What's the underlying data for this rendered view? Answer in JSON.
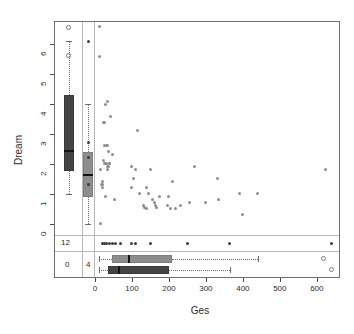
{
  "chart_data": {
    "type": "scatter",
    "title": "",
    "xlabel": "Ges",
    "ylabel": "Dream",
    "xlim": [
      -20,
      660
    ],
    "ylim": [
      -0.35,
      6.75
    ],
    "xticks": [
      0,
      100,
      200,
      300,
      400,
      500,
      600
    ],
    "xticklabels": [
      "0",
      "100",
      "200",
      "300",
      "400",
      "500",
      "600"
    ],
    "yticks": [
      0,
      1,
      2,
      3,
      4,
      5,
      6
    ],
    "yticklabels": [
      "0",
      "1",
      "2",
      "3",
      "4",
      "5",
      "6"
    ],
    "grid": false,
    "legend": null,
    "points": [
      [
        12.0,
        6.6
      ],
      [
        12.5,
        5.6
      ],
      [
        28.0,
        4.0
      ],
      [
        33.0,
        4.1
      ],
      [
        42.0,
        3.6
      ],
      [
        22.0,
        3.4
      ],
      [
        26.0,
        3.4
      ],
      [
        116.0,
        3.1
      ],
      [
        25.0,
        2.6
      ],
      [
        30.0,
        2.6
      ],
      [
        35.0,
        2.6
      ],
      [
        37.0,
        2.4
      ],
      [
        47.0,
        2.3
      ],
      [
        16.0,
        1.8
      ],
      [
        23.0,
        2.1
      ],
      [
        26.0,
        2.0
      ],
      [
        29.0,
        2.0
      ],
      [
        32.0,
        2.0
      ],
      [
        34.0,
        1.9
      ],
      [
        36.0,
        1.9
      ],
      [
        38.0,
        2.0
      ],
      [
        40.0,
        2.0
      ],
      [
        33.0,
        1.8
      ],
      [
        99.0,
        1.9
      ],
      [
        110.0,
        1.8
      ],
      [
        104.0,
        1.5
      ],
      [
        150.0,
        1.8
      ],
      [
        140.0,
        1.2
      ],
      [
        210.0,
        1.4
      ],
      [
        268.0,
        1.9
      ],
      [
        330.0,
        1.5
      ],
      [
        18.0,
        1.3
      ],
      [
        20.0,
        1.3
      ],
      [
        21.0,
        1.4
      ],
      [
        19.0,
        1.2
      ],
      [
        28.0,
        0.9
      ],
      [
        52.0,
        0.8
      ],
      [
        100.0,
        1.2
      ],
      [
        120.0,
        1.0
      ],
      [
        145.0,
        1.0
      ],
      [
        155.0,
        0.8
      ],
      [
        160.0,
        0.7
      ],
      [
        175.0,
        0.9
      ],
      [
        200.0,
        0.9
      ],
      [
        195.0,
        0.6
      ],
      [
        205.0,
        0.5
      ],
      [
        218.0,
        0.5
      ],
      [
        230.0,
        0.6
      ],
      [
        255.0,
        0.7
      ],
      [
        300.0,
        0.7
      ],
      [
        335.0,
        0.8
      ],
      [
        390.0,
        1.0
      ],
      [
        400.0,
        0.3
      ],
      [
        440.0,
        1.0
      ],
      [
        624.0,
        1.8
      ],
      [
        130.0,
        0.6
      ],
      [
        134.0,
        0.55
      ],
      [
        138.0,
        0.5
      ],
      [
        163.0,
        0.6
      ],
      [
        167.0,
        0.55
      ],
      [
        16.0,
        0.0
      ]
    ],
    "missing_x_points": [
      [
        6.1
      ],
      [
        2.7
      ],
      [
        2.2
      ],
      [
        1.3
      ]
    ],
    "missing_y_points": [
      20,
      26,
      32,
      40,
      48,
      56,
      68,
      100,
      110,
      150,
      250,
      365,
      640
    ],
    "missing_counts": {
      "y_missing_label": "12",
      "both_missing_label": "0",
      "x_missing_label": "4"
    },
    "y_boxplots": [
      {
        "name": "all-cases",
        "fill": "#444444",
        "min": 1.0,
        "q1": 1.75,
        "median": 2.45,
        "q3": 4.3,
        "max": 6.1,
        "outliers": [
          6.55,
          5.6
        ]
      },
      {
        "name": "complete-cases",
        "fill": "#8d8d8d",
        "min": 0.0,
        "q1": 0.9,
        "median": 1.65,
        "q3": 2.4,
        "max": 4.0,
        "outliers": []
      }
    ],
    "x_boxplots": [
      {
        "name": "complete-cases",
        "fill": "#8d8d8d",
        "min": 12,
        "q1": 46,
        "median": 90,
        "q3": 208,
        "max": 440,
        "outliers": [
          620
        ]
      },
      {
        "name": "all-cases",
        "fill": "#444444",
        "min": 10,
        "q1": 34,
        "median": 63,
        "q3": 200,
        "max": 365,
        "outliers": [
          640
        ]
      }
    ]
  },
  "axes": {
    "x_title": "Ges",
    "y_title": "Dream"
  }
}
